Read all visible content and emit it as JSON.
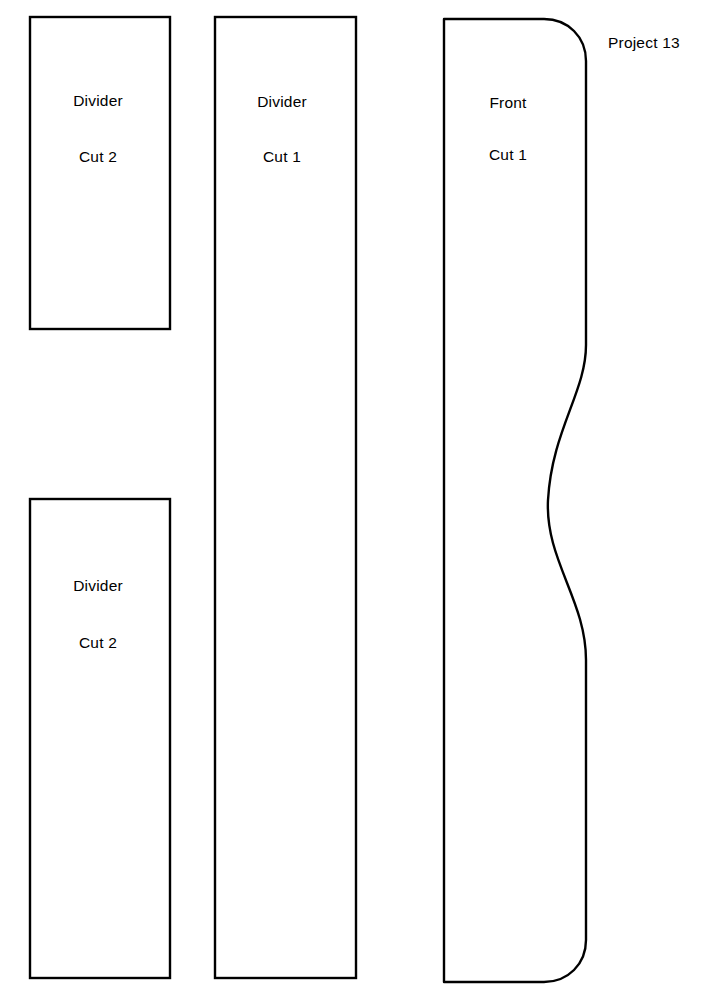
{
  "document": {
    "title": "Project 13",
    "title_position": {
      "x": 608,
      "y": 43
    },
    "background_color": "#ffffff",
    "line_color": "#000000",
    "page_width": 701,
    "page_height": 991
  },
  "pieces": [
    {
      "id": "divider-upper-left",
      "name": "Divider",
      "quantity_label": "Cut 2",
      "shape": "rectangle",
      "rect": {
        "x": 30,
        "y": 17,
        "width": 140,
        "height": 312
      },
      "name_label_position": {
        "x": 98,
        "y": 101
      },
      "quantity_label_position": {
        "x": 98,
        "y": 157
      }
    },
    {
      "id": "divider-lower-left",
      "name": "Divider",
      "quantity_label": "Cut 2",
      "shape": "rectangle",
      "rect": {
        "x": 30,
        "y": 499,
        "width": 140,
        "height": 479
      },
      "name_label_position": {
        "x": 98,
        "y": 586
      },
      "quantity_label_position": {
        "x": 98,
        "y": 643
      }
    },
    {
      "id": "divider-center",
      "name": "Divider",
      "quantity_label": "Cut 1",
      "shape": "rectangle",
      "rect": {
        "x": 215,
        "y": 17,
        "width": 141,
        "height": 961
      },
      "name_label_position": {
        "x": 282,
        "y": 102
      },
      "quantity_label_position": {
        "x": 282,
        "y": 157
      }
    },
    {
      "id": "front-right",
      "name": "Front",
      "quantity_label": "Cut 1",
      "shape": "wavy-panel",
      "rect": {
        "x": 444,
        "y": 19,
        "width": 142,
        "height": 963
      },
      "name_label_position": {
        "x": 508,
        "y": 103
      },
      "quantity_label_position": {
        "x": 508,
        "y": 155
      },
      "corner_radius": 42,
      "wave": {
        "start_y": 345,
        "end_y": 660,
        "right_x": 586,
        "leftmost_x": 548,
        "leftmost_y": 500
      }
    }
  ]
}
